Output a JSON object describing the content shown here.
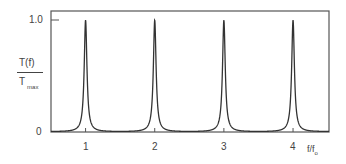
{
  "chart_data": {
    "type": "line",
    "title": "",
    "xlabel": "f/f₀",
    "ylabel": "T(f) / T_max",
    "ylabel_num": "T(f)",
    "ylabel_den_main": "T",
    "ylabel_den_sub": "max",
    "xlabel_main": "f/f",
    "xlabel_sub": "o",
    "x_ticks": [
      "1",
      "2",
      "3",
      "4"
    ],
    "y_ticks": [
      "0",
      "1.0"
    ],
    "xlim": [
      0.5,
      4.52
    ],
    "ylim": [
      0,
      1.0
    ],
    "grid": false,
    "legend": "none",
    "series": [
      {
        "name": "Fabry-Perot transmission",
        "description": "Periodic Lorentzian-like peaks of height 1.0 at integer f/f0",
        "peaks_x": [
          1,
          2,
          3,
          4
        ],
        "peak_value": 1.0,
        "min_value": 0.01,
        "finesse_factor": 180
      }
    ]
  }
}
